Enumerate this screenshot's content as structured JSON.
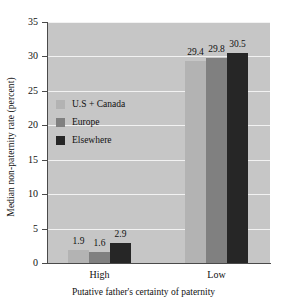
{
  "chart_data": {
    "type": "bar",
    "title": "",
    "xlabel": "Putative father's certainty of paternity",
    "ylabel": "Median non-paternity rate (percent)",
    "categories": [
      "High",
      "Low"
    ],
    "series": [
      {
        "name": "U.S + Canada",
        "values": [
          1.9,
          1.6
        ],
        "color": "#b3b3b3"
      },
      {
        "name": "Europe",
        "values": [
          29.4,
          29.8
        ],
        "color": "#808080"
      },
      {
        "name": "Elsewhere",
        "values": [
          2.9,
          30.5
        ],
        "color": "#262626"
      }
    ],
    "bar_labels": {
      "high": [
        "1.9",
        "1.6",
        "2.9"
      ],
      "low": [
        "29.4",
        "29.8",
        "30.5"
      ]
    },
    "ylim": [
      0,
      35
    ],
    "yticks": [
      "0",
      "5",
      "10",
      "15",
      "20",
      "25",
      "30",
      "35"
    ],
    "grid": true,
    "legend_position": "inside-left",
    "plot_background": "#c6c6c6",
    "gridline_color": "#f2f2f2",
    "axis_color": "#4a4a4a",
    "text_color": "#111111"
  },
  "bars": [
    {
      "group": "High",
      "series": "U.S + Canada",
      "value": 1.9,
      "label": "1.9",
      "color": "#b3b3b3"
    },
    {
      "group": "High",
      "series": "Europe",
      "value": 1.6,
      "label": "1.6",
      "color": "#808080"
    },
    {
      "group": "High",
      "series": "Elsewhere",
      "value": 2.9,
      "label": "2.9",
      "color": "#262626"
    },
    {
      "group": "Low",
      "series": "U.S + Canada",
      "value": 29.4,
      "label": "29.4",
      "color": "#b3b3b3"
    },
    {
      "group": "Low",
      "series": "Europe",
      "value": 29.8,
      "label": "29.8",
      "color": "#808080"
    },
    {
      "group": "Low",
      "series": "Elsewhere",
      "value": 30.5,
      "label": "30.5",
      "color": "#262626"
    }
  ]
}
